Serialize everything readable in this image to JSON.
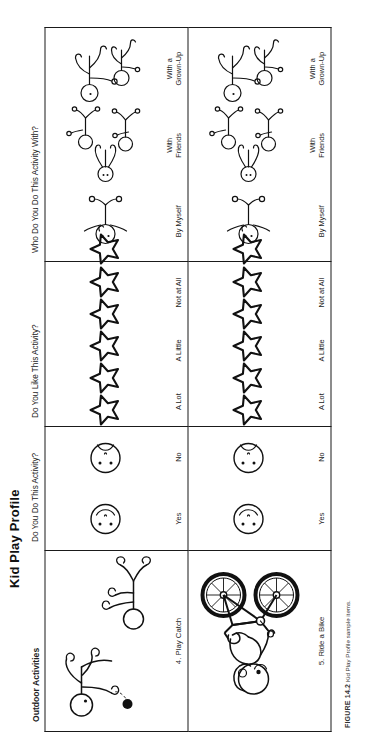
{
  "document": {
    "title": "Kid Play Profile",
    "caption_label": "FIGURE 14.2",
    "caption_text": "Kid Play Profile sample items."
  },
  "columns": [
    {
      "key": "activities",
      "header": "Outdoor Activities",
      "bold": true
    },
    {
      "key": "do",
      "header": "Do You Do This Activity?",
      "bold": false
    },
    {
      "key": "like",
      "header": "Do You Like This Activity?",
      "bold": false
    },
    {
      "key": "who",
      "header": "Who Do You Do This Activity With?",
      "bold": false
    }
  ],
  "scales": {
    "do": [
      "Yes",
      "No"
    ],
    "like": [
      "A Lot",
      "A Little",
      "Not at All"
    ],
    "like_star_counts": [
      3,
      2,
      1
    ],
    "who": [
      "By Myself",
      "With\nFriends",
      "With a\nGrown-Up"
    ]
  },
  "rows": [
    {
      "number": "4.",
      "name": "Play Catch",
      "label": "4. Play Catch",
      "icon": "play-catch-illustration"
    },
    {
      "number": "5.",
      "name": "Ride a Bike",
      "label": "5. Ride a Bike",
      "icon": "ride-a-bike-illustration"
    }
  ],
  "icons": {
    "yes": "smiley-face-icon",
    "no": "frowny-face-icon",
    "star": "star-icon",
    "by_myself": "one-person-icon",
    "with_friends": "three-children-icon",
    "with_grown_up": "adult-and-child-icon"
  },
  "colors": {
    "ink": "#111111",
    "border": "#1a1a1a",
    "paper": "#ffffff"
  }
}
